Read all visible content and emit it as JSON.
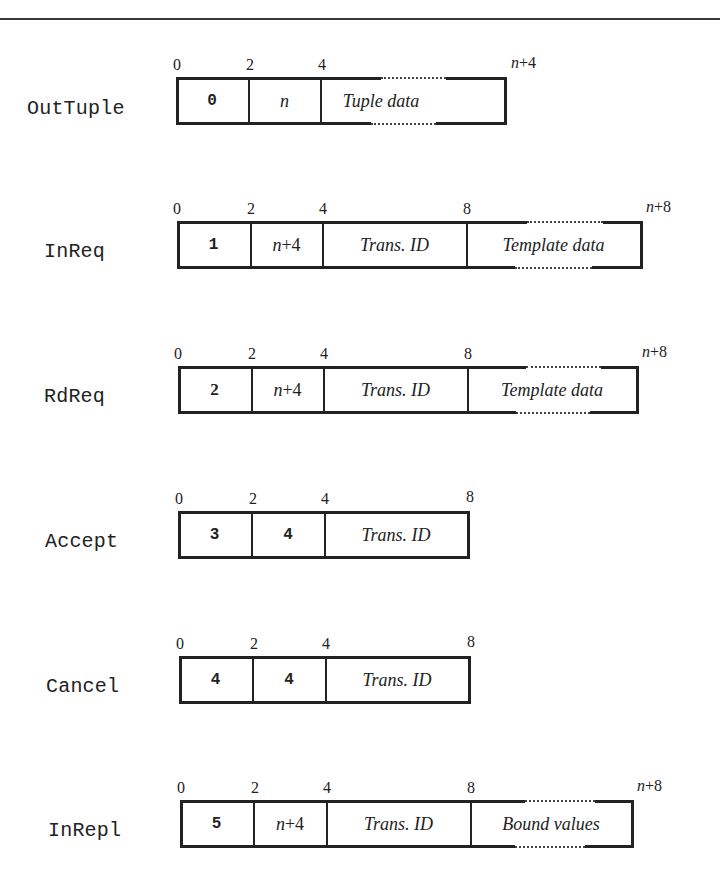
{
  "figure": {
    "messages": [
      {
        "name": "OutTuple",
        "offsets": [
          "0",
          "2",
          "4",
          "n+4"
        ],
        "fields": [
          {
            "label": "0",
            "kind": "code"
          },
          {
            "label": "n",
            "kind": "math"
          },
          {
            "label": "Tuple data",
            "kind": "variable"
          }
        ]
      },
      {
        "name": "InReq",
        "offsets": [
          "0",
          "2",
          "4",
          "8",
          "n+8"
        ],
        "fields": [
          {
            "label": "1",
            "kind": "code"
          },
          {
            "label": "n+4",
            "kind": "math"
          },
          {
            "label": "Trans. ID",
            "kind": "fixed"
          },
          {
            "label": "Template data",
            "kind": "variable"
          }
        ]
      },
      {
        "name": "RdReq",
        "offsets": [
          "0",
          "2",
          "4",
          "8",
          "n+8"
        ],
        "fields": [
          {
            "label": "2",
            "kind": "code"
          },
          {
            "label": "n+4",
            "kind": "math"
          },
          {
            "label": "Trans. ID",
            "kind": "fixed"
          },
          {
            "label": "Template data",
            "kind": "variable"
          }
        ]
      },
      {
        "name": "Accept",
        "offsets": [
          "0",
          "2",
          "4",
          "8"
        ],
        "fields": [
          {
            "label": "3",
            "kind": "code"
          },
          {
            "label": "4",
            "kind": "code"
          },
          {
            "label": "Trans. ID",
            "kind": "fixed"
          }
        ]
      },
      {
        "name": "Cancel",
        "offsets": [
          "0",
          "2",
          "4",
          "8"
        ],
        "fields": [
          {
            "label": "4",
            "kind": "code"
          },
          {
            "label": "4",
            "kind": "code"
          },
          {
            "label": "Trans. ID",
            "kind": "fixed"
          }
        ]
      },
      {
        "name": "InRepl",
        "offsets": [
          "0",
          "2",
          "4",
          "8",
          "n+8"
        ],
        "fields": [
          {
            "label": "5",
            "kind": "code"
          },
          {
            "label": "n+4",
            "kind": "math"
          },
          {
            "label": "Trans. ID",
            "kind": "fixed"
          },
          {
            "label": "Bound values",
            "kind": "variable"
          }
        ]
      }
    ]
  }
}
